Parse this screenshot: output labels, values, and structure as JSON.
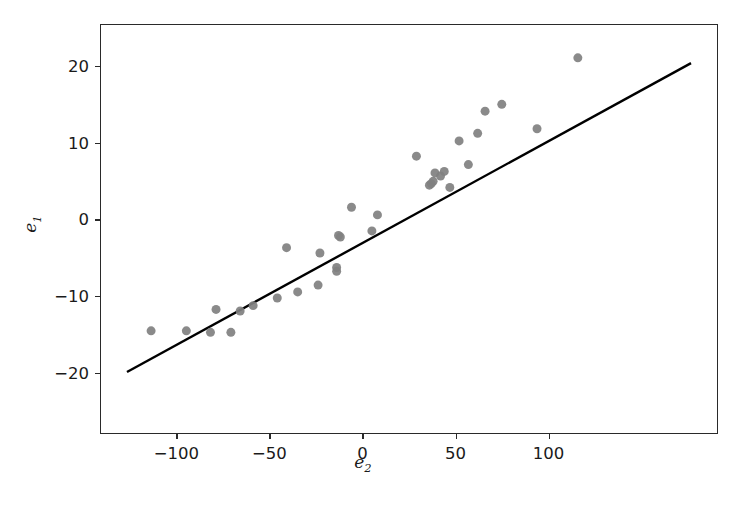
{
  "chart_data": {
    "type": "scatter",
    "title": "",
    "subtitle": "",
    "xlabel": "e",
    "xlabel_sub": "2",
    "ylabel": "e",
    "ylabel_sub": "1",
    "xlim": [
      -141,
      191
    ],
    "ylim": [
      -28,
      25.5
    ],
    "grid": false,
    "legend": null,
    "xticks": [
      -100,
      -50,
      0,
      50,
      100
    ],
    "xticklabels": [
      "−100",
      "−50",
      "0",
      "50",
      "100"
    ],
    "yticks": [
      20,
      10,
      0,
      -10,
      -20
    ],
    "yticklabels": [
      "20",
      "10",
      "0",
      "−10",
      "−20"
    ],
    "marker_color": "#808080",
    "marker_size": 9,
    "line_color": "#000000",
    "line_width": 2.4,
    "series": [
      {
        "name": "residual pairs",
        "type": "scatter",
        "points": [
          [
            -114,
            -14.6
          ],
          [
            -95,
            -14.6
          ],
          [
            -82,
            -14.8
          ],
          [
            -79,
            -11.8
          ],
          [
            -71,
            -14.8
          ],
          [
            -66,
            -12.0
          ],
          [
            -59,
            -11.3
          ],
          [
            -46,
            -10.3
          ],
          [
            -41,
            -3.7
          ],
          [
            -35,
            -9.5
          ],
          [
            -24,
            -8.6
          ],
          [
            -23,
            -4.4
          ],
          [
            -14,
            -6.3
          ],
          [
            -14,
            -6.8
          ],
          [
            -13,
            -2.1
          ],
          [
            -12,
            -2.3
          ],
          [
            -6,
            1.6
          ],
          [
            5,
            -1.5
          ],
          [
            8,
            0.6
          ],
          [
            29,
            8.3
          ],
          [
            36,
            4.5
          ],
          [
            37,
            4.7
          ],
          [
            38,
            5.0
          ],
          [
            39,
            6.1
          ],
          [
            42,
            5.7
          ],
          [
            44,
            6.3
          ],
          [
            47,
            4.2
          ],
          [
            52,
            10.3
          ],
          [
            57,
            7.2
          ],
          [
            62,
            11.3
          ],
          [
            66,
            14.2
          ],
          [
            75,
            15.1
          ],
          [
            94,
            11.9
          ],
          [
            116,
            21.2
          ]
        ]
      },
      {
        "name": "fitted line",
        "type": "line",
        "points": [
          [
            -127,
            -20.0
          ],
          [
            177,
            20.5
          ]
        ]
      }
    ]
  }
}
